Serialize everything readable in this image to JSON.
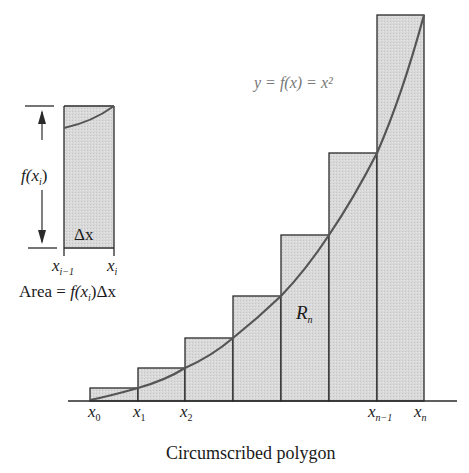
{
  "diagram": {
    "type": "riemann-sum-circumscribed",
    "caption": "Circumscribed polygon",
    "function_label": "y = f(x) = x²",
    "region_label": "R",
    "region_label_sub": "n",
    "colors": {
      "bar_fill": "#d6d6d6",
      "bar_stroke": "#2a2a2a",
      "curve": "#555555",
      "text": "#1a1a1a",
      "function_label_text": "#777777"
    },
    "x_ticks": [
      {
        "base": "x",
        "sub": "0"
      },
      {
        "base": "x",
        "sub": "1"
      },
      {
        "base": "x",
        "sub": "2"
      },
      {
        "base": "x",
        "sub": "n−1"
      },
      {
        "base": "x",
        "sub": "n"
      }
    ],
    "bars": [
      {
        "x0": 90,
        "x1": 138,
        "top": 388
      },
      {
        "x0": 138,
        "x1": 185,
        "top": 368
      },
      {
        "x0": 185,
        "x1": 233,
        "top": 338
      },
      {
        "x0": 233,
        "x1": 281,
        "top": 296
      },
      {
        "x0": 281,
        "x1": 329,
        "top": 235
      },
      {
        "x0": 329,
        "x1": 377,
        "top": 153
      },
      {
        "x0": 377,
        "x1": 424,
        "top": 15
      }
    ],
    "inset": {
      "height_label": "f(x",
      "height_label_sub": "i",
      "height_label_close": ")",
      "width_label": "Δx",
      "left_tick": {
        "base": "x",
        "sub": "i−1"
      },
      "right_tick": {
        "base": "x",
        "sub": "i"
      },
      "area_formula_prefix": "Area = ",
      "area_formula_f": "f(x",
      "area_formula_sub": "i",
      "area_formula_suffix": ")Δx"
    }
  }
}
